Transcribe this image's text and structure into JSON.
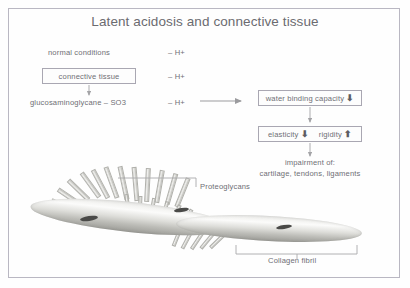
{
  "slide": {
    "title": "Latent acidosis and connective tissue",
    "border_color": "#b9b7c2",
    "text_color": "#6f6f75",
    "background": "#ffffff"
  },
  "left_column": {
    "rows": [
      {
        "label": "normal conditions",
        "proton": "– H+"
      },
      {
        "label": "connective tissue",
        "proton": "– H+",
        "boxed": true
      },
      {
        "label": "glucosaminoglycane – SO3",
        "proton": "– H+"
      }
    ]
  },
  "right_column": {
    "box_water": {
      "label": "water binding capacity",
      "trend": "⬇"
    },
    "box_elasticity": {
      "label_a": "elasticity",
      "trend_a": "⬇",
      "label_b": "rigidity",
      "trend_b": "⬆"
    },
    "outcome_line1": "impairment of:",
    "outcome_line2": "cartilage, tendons, ligaments"
  },
  "illustration": {
    "callout_proteoglycans": "Proteoglycans",
    "callout_collagen": "Collagen fibril"
  }
}
